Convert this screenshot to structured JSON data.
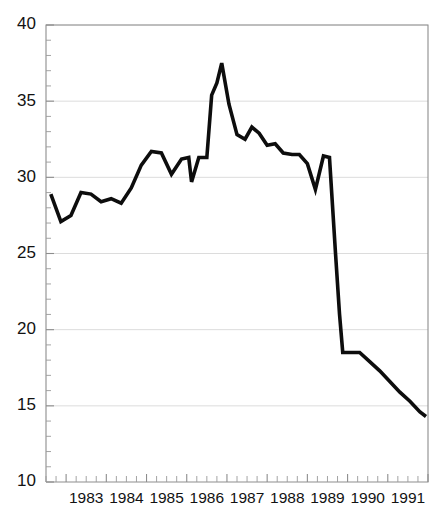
{
  "chart_data": {
    "type": "line",
    "title": "",
    "subtitle": "",
    "xlabel": "",
    "ylabel": "",
    "ylim": [
      10,
      40
    ],
    "xlim": [
      1982.5,
      1992.0
    ],
    "grid": true,
    "legend": false,
    "legend_position": "none",
    "y_ticks_major": [
      10,
      15,
      20,
      25,
      30,
      35,
      40
    ],
    "y_tick_labels": [
      "10",
      "15",
      "20",
      "25",
      "30",
      "35",
      "40"
    ],
    "y_minor_step": 1,
    "x_tick_labels": [
      "1983",
      "1984",
      "1985",
      "1986",
      "1987",
      "1988",
      "1989",
      "1990",
      "1991"
    ],
    "x_tick_label_values": [
      1983,
      1984,
      1985,
      1986,
      1987,
      1988,
      1989,
      1990,
      1991
    ],
    "x_minor_step": 0.25,
    "line_color": "#0d0d0d",
    "grid_color": "#d8d8d8",
    "axis_color": "#8d8d8d",
    "background_color": "#ffffff",
    "series": [
      {
        "name": "series-1",
        "x": [
          1982.62,
          1982.87,
          1983.12,
          1983.37,
          1983.62,
          1983.87,
          1984.12,
          1984.37,
          1984.62,
          1984.87,
          1985.12,
          1985.37,
          1985.62,
          1985.87,
          1986.05,
          1986.12,
          1986.3,
          1986.5,
          1986.62,
          1986.75,
          1986.87,
          1987.05,
          1987.25,
          1987.45,
          1987.62,
          1987.8,
          1988.0,
          1988.2,
          1988.4,
          1988.62,
          1988.8,
          1989.0,
          1989.2,
          1989.4,
          1989.55,
          1989.7,
          1989.8,
          1989.88,
          1990.05,
          1990.3,
          1990.55,
          1990.8,
          1991.05,
          1991.3,
          1991.55,
          1991.8,
          1991.95
        ],
        "y": [
          28.9,
          27.1,
          27.5,
          29.0,
          28.9,
          28.4,
          28.6,
          28.3,
          29.3,
          30.8,
          31.7,
          31.6,
          30.2,
          31.2,
          31.3,
          29.7,
          31.3,
          31.3,
          35.4,
          36.2,
          37.5,
          34.8,
          32.8,
          32.5,
          33.3,
          32.9,
          32.1,
          32.2,
          31.6,
          31.5,
          31.5,
          30.9,
          29.2,
          31.4,
          31.3,
          25.0,
          21.0,
          18.5,
          18.5,
          18.5,
          17.9,
          17.3,
          16.6,
          15.9,
          15.3,
          14.6,
          14.3
        ]
      }
    ]
  },
  "axes": {
    "y_labels": [
      "40",
      "35",
      "30",
      "25",
      "20",
      "15",
      "10"
    ],
    "x_labels": [
      "1983",
      "1984",
      "1985",
      "1986",
      "1987",
      "1988",
      "1989",
      "1990",
      "1991"
    ]
  }
}
